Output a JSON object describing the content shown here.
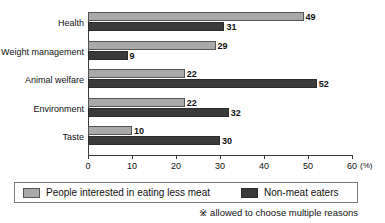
{
  "chart_data": {
    "type": "bar",
    "orientation": "horizontal",
    "title": "",
    "xlabel": "(%)",
    "ylabel": "",
    "xlim": [
      0,
      60
    ],
    "xticks": [
      0,
      10,
      20,
      30,
      40,
      50,
      60
    ],
    "xtick_labels": [
      "0",
      "10",
      "20",
      "30",
      "40",
      "50",
      "60"
    ],
    "grid": false,
    "legend_position": "bottom",
    "categories": [
      "Health",
      "Weight management",
      "Animal welfare",
      "Environment",
      "Taste"
    ],
    "series": [
      {
        "name": "People interested in eating less meat",
        "color": "#a9a9a9",
        "values": [
          49,
          29,
          22,
          22,
          10
        ]
      },
      {
        "name": "Non-meat eaters",
        "color": "#3a3a3a",
        "values": [
          31,
          9,
          52,
          32,
          30
        ]
      }
    ],
    "annotations": [
      "※ allowed to choose multiple reasons"
    ]
  },
  "axis": {
    "unit_label": "(%)"
  },
  "legend": {
    "items": [
      {
        "label": "People interested in eating less meat",
        "swatch": "light-gray-swatch"
      },
      {
        "label": "Non-meat eaters",
        "swatch": "dark-gray-swatch"
      }
    ]
  },
  "footnote": {
    "text": "※ allowed to choose multiple reasons"
  }
}
